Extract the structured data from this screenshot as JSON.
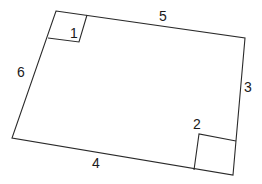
{
  "diagram": {
    "type": "quadrilateral with right-angle markers",
    "vertices": {
      "top_left": [
        56,
        11
      ],
      "top_right": [
        245,
        38
      ],
      "bottom_right": [
        233,
        175
      ],
      "bottom_left": [
        12,
        138
      ]
    },
    "side_labels": {
      "top": "5",
      "right": "3",
      "bottom": "4",
      "left": "6"
    },
    "angle_labels": {
      "top_left": "1",
      "bottom_right": "2"
    },
    "colors": {
      "line": "#2a2a2a",
      "text": "#1a1a1a",
      "background": "#ffffff"
    }
  }
}
